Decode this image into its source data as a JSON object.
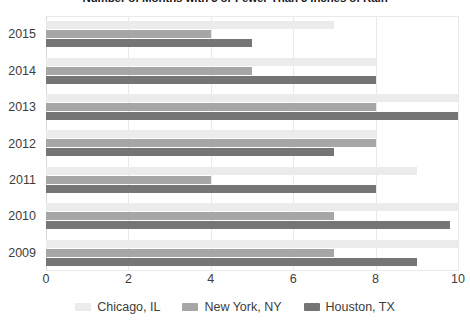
{
  "chart_data": {
    "type": "bar",
    "orientation": "horizontal",
    "title": "Number of Months with 3 or Fewer Than 3 Inches of Rain",
    "xlabel": "",
    "ylabel": "",
    "categories": [
      "2009",
      "2010",
      "2011",
      "2012",
      "2013",
      "2014",
      "2015"
    ],
    "display_order": [
      "2015",
      "2014",
      "2013",
      "2012",
      "2011",
      "2010",
      "2009"
    ],
    "series": [
      {
        "name": "Chicago, IL",
        "color": "#ebebeb",
        "values": [
          10,
          10,
          9,
          8,
          10,
          8,
          7
        ]
      },
      {
        "name": "New York, NY",
        "color": "#a6a6a6",
        "values": [
          7,
          7,
          4,
          8,
          8,
          5,
          4
        ]
      },
      {
        "name": "Houston, TX",
        "color": "#757575",
        "values": [
          9,
          9.8,
          8,
          7,
          10,
          8,
          5
        ]
      }
    ],
    "xlim": [
      0,
      10
    ],
    "xticks": [
      0,
      2,
      4,
      6,
      8,
      10
    ],
    "xtick_labels": [
      "0",
      "2",
      "4",
      "6",
      "8",
      "10"
    ],
    "grid": true,
    "grid_axis": "x",
    "legend_position": "bottom"
  },
  "legend": {
    "items": [
      {
        "label": "Chicago, IL"
      },
      {
        "label": "New York, NY"
      },
      {
        "label": "Houston, TX"
      }
    ]
  },
  "y_axis": {
    "labels": [
      "2015",
      "2014",
      "2013",
      "2012",
      "2011",
      "2010",
      "2009"
    ]
  },
  "x_axis": {
    "labels": [
      "0",
      "2",
      "4",
      "6",
      "8",
      "10"
    ]
  }
}
